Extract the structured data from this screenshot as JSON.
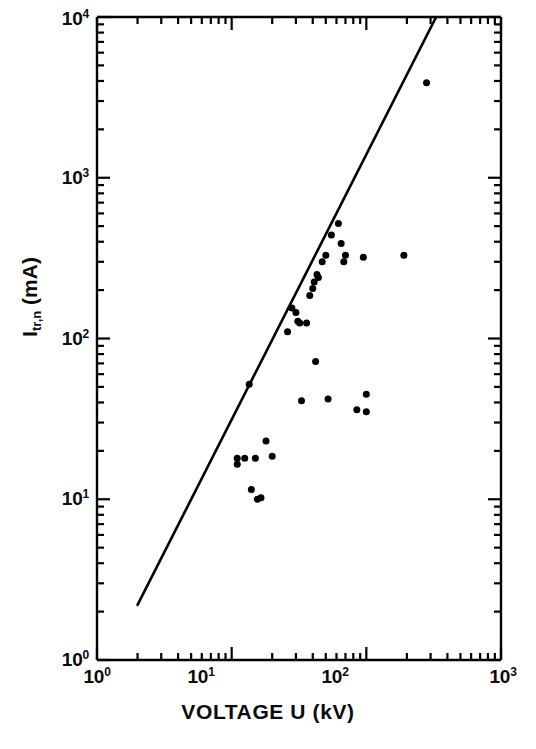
{
  "chart_data": {
    "type": "scatter",
    "title": "",
    "subtitle": "",
    "xlabel": "VOLTAGE U (kV)",
    "ylabel": "I_tr,n (mA)",
    "ylabel_base": "I",
    "ylabel_subscript": "tr,n",
    "ylabel_units": "(mA)",
    "xscale": "log",
    "yscale": "log",
    "xlim": [
      1,
      1000
    ],
    "ylim": [
      1,
      10000
    ],
    "grid": false,
    "legend": null,
    "xtick_labels": [
      "10⁰",
      "10¹",
      "10²",
      "10³"
    ],
    "xtick_values": [
      1,
      10,
      100,
      1000
    ],
    "xtick_mantissas": [
      "10",
      "10",
      "10",
      "10"
    ],
    "xtick_exponents": [
      "0",
      "1",
      "2",
      "3"
    ],
    "ytick_labels": [
      "10⁰",
      "10¹",
      "10²",
      "10³",
      "10⁴"
    ],
    "ytick_values": [
      1,
      10,
      100,
      1000,
      10000
    ],
    "ytick_mantissas": [
      "10",
      "10",
      "10",
      "10",
      "10"
    ],
    "ytick_exponents": [
      "0",
      "1",
      "2",
      "3",
      "4"
    ],
    "minor_ticks": [
      2,
      3,
      4,
      5,
      6,
      7,
      8,
      9
    ],
    "marker_color": "#000000",
    "marker_shape": "filled-circle",
    "marker_size_px": 7,
    "line_color": "#000000",
    "line_width_px": 2.6,
    "axis_color": "#000000",
    "background_color": "#ffffff",
    "series": [
      {
        "name": "measured points",
        "type": "scatter",
        "points": [
          {
            "x": 11.0,
            "y": 18.0
          },
          {
            "x": 11.0,
            "y": 16.5
          },
          {
            "x": 12.5,
            "y": 18.0
          },
          {
            "x": 13.5,
            "y": 52.0
          },
          {
            "x": 14.0,
            "y": 11.5
          },
          {
            "x": 15.0,
            "y": 18.0
          },
          {
            "x": 15.5,
            "y": 10.0
          },
          {
            "x": 16.5,
            "y": 10.2
          },
          {
            "x": 18.0,
            "y": 23.0
          },
          {
            "x": 20.0,
            "y": 18.5
          },
          {
            "x": 26.0,
            "y": 110.0
          },
          {
            "x": 28.0,
            "y": 155.0
          },
          {
            "x": 30.0,
            "y": 145.0
          },
          {
            "x": 31.0,
            "y": 128.0
          },
          {
            "x": 32.0,
            "y": 125.0
          },
          {
            "x": 33.0,
            "y": 41.0
          },
          {
            "x": 36.0,
            "y": 125.0
          },
          {
            "x": 38.0,
            "y": 185.0
          },
          {
            "x": 40.0,
            "y": 205.0
          },
          {
            "x": 41.0,
            "y": 225.0
          },
          {
            "x": 42.0,
            "y": 72.0
          },
          {
            "x": 43.0,
            "y": 250.0
          },
          {
            "x": 44.0,
            "y": 240.0
          },
          {
            "x": 47.0,
            "y": 300.0
          },
          {
            "x": 50.0,
            "y": 330.0
          },
          {
            "x": 52.0,
            "y": 42.0
          },
          {
            "x": 55.0,
            "y": 440.0
          },
          {
            "x": 62.0,
            "y": 520.0
          },
          {
            "x": 65.0,
            "y": 390.0
          },
          {
            "x": 68.0,
            "y": 300.0
          },
          {
            "x": 70.0,
            "y": 330.0
          },
          {
            "x": 85.0,
            "y": 36.0
          },
          {
            "x": 95.0,
            "y": 320.0
          },
          {
            "x": 100.0,
            "y": 45.0
          },
          {
            "x": 100.0,
            "y": 35.0
          },
          {
            "x": 190.0,
            "y": 330.0
          },
          {
            "x": 280.0,
            "y": 3900.0
          }
        ]
      },
      {
        "name": "fitted trend line",
        "type": "line",
        "x_start": 2.0,
        "y_start": 2.2,
        "x_end": 330.0,
        "y_end": 10000.0,
        "slope_loglog": 1.66
      }
    ]
  },
  "axes": {
    "x_axis_name": "voltage-axis",
    "y_axis_name": "current-axis"
  }
}
